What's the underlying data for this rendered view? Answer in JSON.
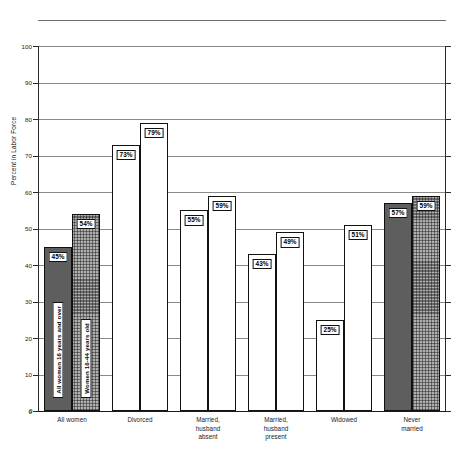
{
  "chart_data": {
    "type": "bar",
    "title": "",
    "xlabel": "",
    "ylabel": "Percent in Labor Force",
    "ylim": [
      0,
      100
    ],
    "yticks": [
      0,
      10,
      20,
      30,
      40,
      50,
      60,
      70,
      80,
      90,
      100
    ],
    "ytick_labels": [
      "0",
      "10",
      "20",
      "30",
      "40",
      "50",
      "60",
      "70",
      "80",
      "90",
      "100"
    ],
    "grid": true,
    "legend_position": "in-plot-first-group",
    "categories": [
      "All women",
      "Divorced",
      "Married,\nhusband\nabsent",
      "Married,\nhusband\npresent",
      "Widowed",
      "Never\nmarried"
    ],
    "series": [
      {
        "name": "All women 16 years and over",
        "values": [
          45,
          73,
          55,
          43,
          25,
          57
        ],
        "value_labels": [
          "45%",
          "73%",
          "55%",
          "43%",
          "25%",
          "57%"
        ],
        "fill": "dark-crosshatch",
        "color": "#5e5e5e"
      },
      {
        "name": "Women 16-44 years old",
        "values": [
          54,
          79,
          59,
          49,
          51,
          59
        ],
        "value_labels": [
          "54%",
          "79%",
          "59%",
          "49%",
          "51%",
          "59%"
        ],
        "fill": "light-dot",
        "color": "#aeaeae"
      }
    ]
  },
  "axis": {
    "y_title": "Percent in Labor Force",
    "zero_label": "0"
  }
}
